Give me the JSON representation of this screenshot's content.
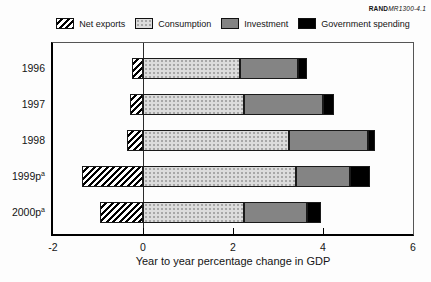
{
  "stamp": {
    "brand": "RAND",
    "doc_id": "MR1300-4.1"
  },
  "chart_data": {
    "type": "bar",
    "orientation": "horizontal",
    "stacked": true,
    "title": "",
    "xlabel": "Year to year percentage change in GDP",
    "ylabel": "",
    "xlim": [
      -2,
      6
    ],
    "xticks": [
      -2,
      0,
      2,
      4,
      6
    ],
    "zero_line": true,
    "grid": false,
    "legend_position": "top",
    "categories": [
      "1996",
      "1997",
      "1998",
      "1999p",
      "2000p"
    ],
    "category_superscripts": [
      "",
      "",
      "",
      "a",
      "a"
    ],
    "series": [
      {
        "key": "net_exports",
        "name": "Net exports",
        "pattern": "hatch",
        "color": "#ffffff",
        "values": [
          -0.25,
          -0.3,
          -0.35,
          -1.35,
          -0.95
        ]
      },
      {
        "key": "consumption",
        "name": "Consumption",
        "pattern": "dots",
        "color": "#dcdcdc",
        "values": [
          2.15,
          2.25,
          3.25,
          3.4,
          2.25
        ]
      },
      {
        "key": "investment",
        "name": "Investment",
        "pattern": null,
        "color": "#848484",
        "values": [
          1.3,
          1.75,
          1.75,
          1.2,
          1.4
        ]
      },
      {
        "key": "government_spending",
        "name": "Government spending",
        "pattern": null,
        "color": "#000000",
        "values": [
          0.2,
          0.25,
          0.15,
          0.45,
          0.3
        ]
      }
    ]
  }
}
